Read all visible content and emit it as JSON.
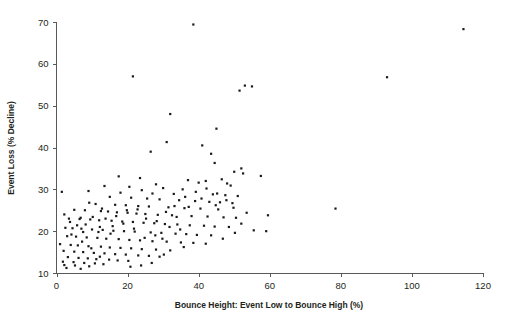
{
  "figure": {
    "background": "#ffffff",
    "point_color": "#1a1a1a",
    "axis_color": "#58595b"
  },
  "chart_data": {
    "type": "scatter",
    "title": "",
    "subtitle": "",
    "xlabel": "Bounce Height: Event Low to Bounce High (%)",
    "ylabel": "Event Loss (% Decline)",
    "xlim": [
      0,
      120
    ],
    "ylim": [
      10,
      70
    ],
    "xticks": [
      0,
      20,
      40,
      60,
      80,
      100,
      120
    ],
    "yticks": [
      10,
      20,
      30,
      40,
      50,
      60,
      70
    ],
    "xtick_labels": [
      "0",
      "20",
      "40",
      "60",
      "80",
      "100",
      "120"
    ],
    "ytick_labels": [
      "10",
      "20",
      "30",
      "40",
      "50",
      "60",
      "70"
    ],
    "grid": false,
    "legend": null,
    "marker": "square",
    "marker_size": 2.2,
    "series": [
      {
        "name": "events",
        "points": [
          [
            38.5,
            69.4
          ],
          [
            114.5,
            68.3
          ],
          [
            21.5,
            57.0
          ],
          [
            93.0,
            56.8
          ],
          [
            53.0,
            54.8
          ],
          [
            55.0,
            54.6
          ],
          [
            51.5,
            53.6
          ],
          [
            32.0,
            48.0
          ],
          [
            45.0,
            44.5
          ],
          [
            31.0,
            41.3
          ],
          [
            41.0,
            40.5
          ],
          [
            26.5,
            39.0
          ],
          [
            43.5,
            38.5
          ],
          [
            44.5,
            36.3
          ],
          [
            52.0,
            35.0
          ],
          [
            50.0,
            34.2
          ],
          [
            52.5,
            33.8
          ],
          [
            57.5,
            33.2
          ],
          [
            17.5,
            33.1
          ],
          [
            23.5,
            32.7
          ],
          [
            46.5,
            32.4
          ],
          [
            37.0,
            32.2
          ],
          [
            42.0,
            32.0
          ],
          [
            40.0,
            31.6
          ],
          [
            48.0,
            31.4
          ],
          [
            28.0,
            31.2
          ],
          [
            49.0,
            30.9
          ],
          [
            13.5,
            30.8
          ],
          [
            20.5,
            30.6
          ],
          [
            30.0,
            30.3
          ],
          [
            35.5,
            30.0
          ],
          [
            24.0,
            29.8
          ],
          [
            9.0,
            29.6
          ],
          [
            1.5,
            29.4
          ],
          [
            18.0,
            29.2
          ],
          [
            27.0,
            29.0
          ],
          [
            33.0,
            28.9
          ],
          [
            44.0,
            28.8
          ],
          [
            47.5,
            28.6
          ],
          [
            51.0,
            28.4
          ],
          [
            15.0,
            28.2
          ],
          [
            21.0,
            28.0
          ],
          [
            25.5,
            27.8
          ],
          [
            29.0,
            27.6
          ],
          [
            34.5,
            27.4
          ],
          [
            39.0,
            27.2
          ],
          [
            43.0,
            27.0
          ],
          [
            46.0,
            26.9
          ],
          [
            49.5,
            26.7
          ],
          [
            11.0,
            26.5
          ],
          [
            16.5,
            26.3
          ],
          [
            19.5,
            26.2
          ],
          [
            23.0,
            26.0
          ],
          [
            26.0,
            25.9
          ],
          [
            31.5,
            25.7
          ],
          [
            36.0,
            25.5
          ],
          [
            40.5,
            25.4
          ],
          [
            45.5,
            25.2
          ],
          [
            5.0,
            25.1
          ],
          [
            8.0,
            25.0
          ],
          [
            12.5,
            24.8
          ],
          [
            14.5,
            24.7
          ],
          [
            17.0,
            24.5
          ],
          [
            20.0,
            24.4
          ],
          [
            22.5,
            24.2
          ],
          [
            25.0,
            24.1
          ],
          [
            28.5,
            23.9
          ],
          [
            32.5,
            23.8
          ],
          [
            38.0,
            23.6
          ],
          [
            42.5,
            23.5
          ],
          [
            47.0,
            23.3
          ],
          [
            50.5,
            23.2
          ],
          [
            3.5,
            23.0
          ],
          [
            6.5,
            22.9
          ],
          [
            9.5,
            22.8
          ],
          [
            12.0,
            22.6
          ],
          [
            15.5,
            22.5
          ],
          [
            18.5,
            22.3
          ],
          [
            21.5,
            22.2
          ],
          [
            24.5,
            22.0
          ],
          [
            27.5,
            21.9
          ],
          [
            30.5,
            21.7
          ],
          [
            34.0,
            21.6
          ],
          [
            37.5,
            21.4
          ],
          [
            41.5,
            21.3
          ],
          [
            44.5,
            21.1
          ],
          [
            48.5,
            21.0
          ],
          [
            2.5,
            20.8
          ],
          [
            4.5,
            20.7
          ],
          [
            7.0,
            20.6
          ],
          [
            10.0,
            20.4
          ],
          [
            13.0,
            20.3
          ],
          [
            16.0,
            20.1
          ],
          [
            19.0,
            20.0
          ],
          [
            22.0,
            19.9
          ],
          [
            26.5,
            19.7
          ],
          [
            29.5,
            19.6
          ],
          [
            33.5,
            19.4
          ],
          [
            36.5,
            19.3
          ],
          [
            39.5,
            19.1
          ],
          [
            43.5,
            19.0
          ],
          [
            52.0,
            21.8
          ],
          [
            55.5,
            20.2
          ],
          [
            59.0,
            20.0
          ],
          [
            59.5,
            23.8
          ],
          [
            78.5,
            25.4
          ],
          [
            3.0,
            18.8
          ],
          [
            5.5,
            18.7
          ],
          [
            8.5,
            18.5
          ],
          [
            11.5,
            18.4
          ],
          [
            14.0,
            18.2
          ],
          [
            17.5,
            18.1
          ],
          [
            20.5,
            17.9
          ],
          [
            23.5,
            17.8
          ],
          [
            27.0,
            17.6
          ],
          [
            31.0,
            17.5
          ],
          [
            35.0,
            17.3
          ],
          [
            38.5,
            17.2
          ],
          [
            42.0,
            17.0
          ],
          [
            1.0,
            16.9
          ],
          [
            4.0,
            16.7
          ],
          [
            6.0,
            16.6
          ],
          [
            9.0,
            16.4
          ],
          [
            12.5,
            16.3
          ],
          [
            15.0,
            16.1
          ],
          [
            18.0,
            16.0
          ],
          [
            21.0,
            15.9
          ],
          [
            24.0,
            15.7
          ],
          [
            28.0,
            15.6
          ],
          [
            32.0,
            15.4
          ],
          [
            2.0,
            15.3
          ],
          [
            5.0,
            15.1
          ],
          [
            7.5,
            15.0
          ],
          [
            10.5,
            14.8
          ],
          [
            13.5,
            14.7
          ],
          [
            16.5,
            14.5
          ],
          [
            19.5,
            14.4
          ],
          [
            23.0,
            14.2
          ],
          [
            26.0,
            14.1
          ],
          [
            29.0,
            13.9
          ],
          [
            3.2,
            13.8
          ],
          [
            6.2,
            13.6
          ],
          [
            8.8,
            13.5
          ],
          [
            11.2,
            13.3
          ],
          [
            14.8,
            13.2
          ],
          [
            17.2,
            13.0
          ],
          [
            20.2,
            12.9
          ],
          [
            1.8,
            12.7
          ],
          [
            4.8,
            12.6
          ],
          [
            7.8,
            12.4
          ],
          [
            10.8,
            12.3
          ],
          [
            13.2,
            12.1
          ],
          [
            2.2,
            11.9
          ],
          [
            5.2,
            11.8
          ],
          [
            9.2,
            11.6
          ],
          [
            2.8,
            11.2
          ],
          [
            6.8,
            11.0
          ],
          [
            12.2,
            13.9
          ],
          [
            9.8,
            15.9
          ],
          [
            7.2,
            17.5
          ],
          [
            4.2,
            19.2
          ],
          [
            11.8,
            19.8
          ],
          [
            15.8,
            21.2
          ],
          [
            8.2,
            21.6
          ],
          [
            6.8,
            23.2
          ],
          [
            10.2,
            23.4
          ],
          [
            13.8,
            23.0
          ],
          [
            16.8,
            23.6
          ],
          [
            19.8,
            25.0
          ],
          [
            12.8,
            25.4
          ],
          [
            9.2,
            26.8
          ],
          [
            22.8,
            25.2
          ],
          [
            25.2,
            23.0
          ],
          [
            28.2,
            22.4
          ],
          [
            30.8,
            24.6
          ],
          [
            33.2,
            26.0
          ],
          [
            36.2,
            28.2
          ],
          [
            39.2,
            29.4
          ],
          [
            42.2,
            30.2
          ],
          [
            45.2,
            29.0
          ],
          [
            47.8,
            27.4
          ],
          [
            31.8,
            21.0
          ],
          [
            34.8,
            20.4
          ],
          [
            27.8,
            19.0
          ],
          [
            24.8,
            18.4
          ],
          [
            21.8,
            20.6
          ],
          [
            18.8,
            21.8
          ],
          [
            15.2,
            19.4
          ],
          [
            12.2,
            21.0
          ],
          [
            7.5,
            19.8
          ],
          [
            5.8,
            21.4
          ],
          [
            3.8,
            22.2
          ],
          [
            2.2,
            24.0
          ],
          [
            23.8,
            11.8
          ],
          [
            26.8,
            12.4
          ],
          [
            20.8,
            11.5
          ],
          [
            29.8,
            18.2
          ],
          [
            33.8,
            23.4
          ],
          [
            37.2,
            25.8
          ],
          [
            40.8,
            27.8
          ],
          [
            44.8,
            26.2
          ],
          [
            49.8,
            25.6
          ],
          [
            53.5,
            24.4
          ],
          [
            50.2,
            19.6
          ],
          [
            46.8,
            18.2
          ],
          [
            35.8,
            16.2
          ],
          [
            30.2,
            14.4
          ]
        ]
      }
    ]
  },
  "axes": {
    "x_title": "Bounce Height: Event Low to Bounce High (%)",
    "y_title": "Event Loss (% Decline)"
  }
}
